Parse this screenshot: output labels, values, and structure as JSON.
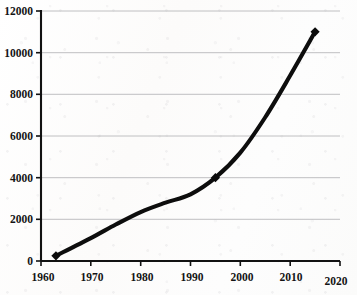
{
  "chart_data": {
    "type": "line",
    "title": "",
    "subtitle": "",
    "xlabel": "",
    "ylabel": "",
    "xlim": [
      1960,
      2020
    ],
    "ylim": [
      0,
      12000
    ],
    "grid": "horizontal",
    "legend": "none",
    "marker": "diamond",
    "line_color": "#0d0d0d",
    "grid_color": "#b9b9bb",
    "axis_color": "#121212",
    "background_color": "#fdfdfc",
    "x_ticks": [
      1960,
      1970,
      1980,
      1990,
      2000,
      2010,
      2020
    ],
    "x_tick_labels": [
      "1960",
      "1970",
      "1980",
      "1990",
      "2000",
      "2010",
      "2020"
    ],
    "y_ticks": [
      0,
      2000,
      4000,
      6000,
      8000,
      10000,
      12000
    ],
    "y_tick_labels": [
      "0",
      "2000",
      "4000",
      "6000",
      "8000",
      "10000",
      "12000"
    ],
    "series": [
      {
        "name": "series-1",
        "marked_points": [
          {
            "x": 1963,
            "y": 250
          },
          {
            "x": 1995,
            "y": 4000
          },
          {
            "x": 2015,
            "y": 11000
          }
        ],
        "x": [
          1963,
          1970,
          1975,
          1980,
          1985,
          1990,
          1995,
          2000,
          2005,
          2010,
          2015
        ],
        "values": [
          250,
          1100,
          1750,
          2350,
          2800,
          3200,
          4000,
          5200,
          6900,
          8900,
          11000
        ]
      }
    ]
  }
}
